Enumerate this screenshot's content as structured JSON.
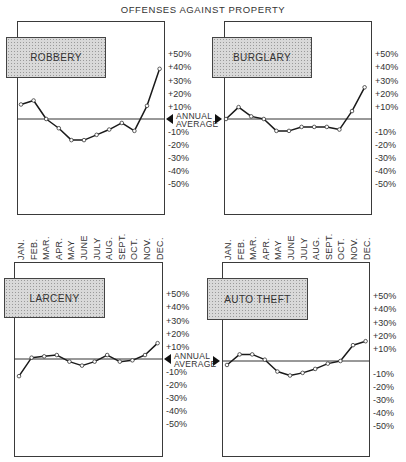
{
  "title": "OFFENSES AGAINST PROPERTY",
  "y_ticks": [
    "+50%",
    "+40%",
    "+30%",
    "+20%",
    "+10%",
    "-10%",
    "-20%",
    "-30%",
    "-40%",
    "-50%"
  ],
  "baseline_label": [
    "ANNUAL",
    "AVERAGE"
  ],
  "months": [
    "JAN.",
    "FEB.",
    "MAR.",
    "APR.",
    "MAY",
    "JUNE",
    "JULY",
    "AUG.",
    "SEPT.",
    "OCT.",
    "NOV.",
    "DEC."
  ],
  "chart_data": [
    {
      "type": "line",
      "title": "ROBBERY",
      "categories": [
        "JAN.",
        "FEB.",
        "MAR.",
        "APR.",
        "MAY",
        "JUNE",
        "JULY",
        "AUG.",
        "SEPT.",
        "OCT.",
        "NOV.",
        "DEC."
      ],
      "values": [
        11,
        14,
        0,
        -7,
        -16,
        -16,
        -12,
        -8,
        -3,
        -9,
        10,
        38
      ],
      "xlabel": "",
      "ylabel": "% deviation from annual average",
      "ylim": [
        -50,
        50
      ],
      "baseline": "ANNUAL AVERAGE (0%)",
      "grid": false
    },
    {
      "type": "line",
      "title": "BURGLARY",
      "categories": [
        "JAN.",
        "FEB.",
        "MAR.",
        "APR.",
        "MAY",
        "JUNE",
        "JULY",
        "AUG.",
        "SEPT.",
        "OCT.",
        "NOV.",
        "DEC."
      ],
      "values": [
        0,
        9,
        2,
        0,
        -9,
        -9,
        -6,
        -6,
        -6,
        -8,
        6,
        24
      ],
      "xlabel": "",
      "ylabel": "% deviation from annual average",
      "ylim": [
        -50,
        50
      ],
      "baseline": "ANNUAL AVERAGE (0%)",
      "grid": false
    },
    {
      "type": "line",
      "title": "LARCENY",
      "categories": [
        "JAN.",
        "FEB.",
        "MAR.",
        "APR.",
        "MAY",
        "JUNE",
        "JULY",
        "AUG.",
        "SEPT.",
        "OCT.",
        "NOV.",
        "DEC."
      ],
      "values": [
        -13,
        1,
        2,
        3,
        -2,
        -5,
        -2,
        3,
        -2,
        -1,
        3,
        12
      ],
      "xlabel": "",
      "ylabel": "% deviation from annual average",
      "ylim": [
        -50,
        50
      ],
      "baseline": "ANNUAL AVERAGE (0%)",
      "grid": false
    },
    {
      "type": "line",
      "title": "AUTO THEFT",
      "categories": [
        "JAN.",
        "FEB.",
        "MAR.",
        "APR.",
        "MAY",
        "JUNE",
        "JULY",
        "AUG.",
        "SEPT.",
        "OCT.",
        "NOV.",
        "DEC."
      ],
      "values": [
        -3,
        5,
        5,
        1,
        -8,
        -11,
        -9,
        -6,
        -2,
        0,
        12,
        15
      ],
      "xlabel": "",
      "ylabel": "% deviation from annual average",
      "ylim": [
        -50,
        50
      ],
      "baseline": "ANNUAL AVERAGE (0%)",
      "grid": false
    }
  ]
}
